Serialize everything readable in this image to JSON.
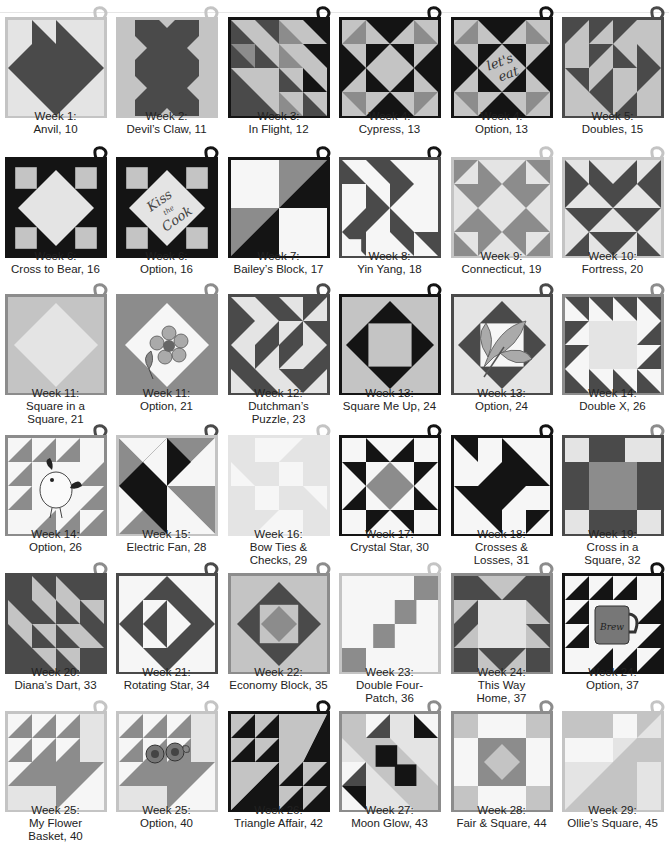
{
  "palette": {
    "black": "#141414",
    "dark": "#4a4a4a",
    "mid": "#8c8c8c",
    "light": "#c4c4c4",
    "pale": "#e4e4e4",
    "white": "#f6f6f6"
  },
  "blocks": [
    {
      "week": "Week 1:",
      "name": "Anvil, 10",
      "pattern": "anvil",
      "border": "light",
      "loop": "light"
    },
    {
      "week": "Week 2:",
      "name": "Devil’s Claw, 11",
      "pattern": "devils-claw",
      "border": "light",
      "loop": "light"
    },
    {
      "week": "Week 3:",
      "name": "In Flight, 12",
      "pattern": "in-flight",
      "border": "black",
      "loop": "black"
    },
    {
      "week": "Week 4:",
      "name": "Cypress, 13",
      "pattern": "cypress",
      "border": "black",
      "loop": "black"
    },
    {
      "week": "Week 4:",
      "name": "Option, 13",
      "pattern": "cypress-option",
      "border": "black",
      "loop": "black",
      "embroidery": "let's eat"
    },
    {
      "week": "Week 5:",
      "name": "Doubles, 15",
      "pattern": "doubles",
      "border": "dark",
      "loop": "dark"
    },
    {
      "week": "Week 6:",
      "name": "Cross to Bear, 16",
      "pattern": "cross-to-bear",
      "border": "black",
      "loop": "black"
    },
    {
      "week": "Week 6:",
      "name": "Option, 16",
      "pattern": "cross-option",
      "border": "black",
      "loop": "black",
      "embroidery": "Kiss the Cook"
    },
    {
      "week": "Week 7:",
      "name": "Bailey’s Block, 17",
      "pattern": "baileys",
      "border": "black",
      "loop": "black"
    },
    {
      "week": "Week 8:",
      "name": "Yin Yang, 18",
      "pattern": "yin-yang",
      "border": "dark",
      "loop": "black"
    },
    {
      "week": "Week 9:",
      "name": "Connecticut, 19",
      "pattern": "connecticut",
      "border": "light",
      "loop": "light"
    },
    {
      "week": "Week 10:",
      "name": "Fortress, 20",
      "pattern": "fortress",
      "border": "light",
      "loop": "light"
    },
    {
      "week": "Week 11:",
      "name": "Square in a Square, 21",
      "caption_lines": [
        "Week 11:",
        "Square in a",
        "Square, 21"
      ],
      "pattern": "square-in-square",
      "border": "mid",
      "loop": "mid"
    },
    {
      "week": "Week 11:",
      "name": "Option, 21",
      "pattern": "square-option",
      "border": "mid",
      "loop": "mid"
    },
    {
      "week": "Week 12:",
      "name": "Dutchman’s Puzzle, 23",
      "caption_lines": [
        "Week 12:",
        "Dutchman’s",
        "Puzzle, 23"
      ],
      "pattern": "dutchman",
      "border": "dark",
      "loop": "dark"
    },
    {
      "week": "Week 13:",
      "name": "Square Me Up, 24",
      "pattern": "square-me-up",
      "border": "black",
      "loop": "black"
    },
    {
      "week": "Week 13:",
      "name": "Option, 24",
      "pattern": "square-me-up-option",
      "border": "dark",
      "loop": "dark"
    },
    {
      "week": "Week 14:",
      "name": "Double X, 26",
      "pattern": "double-x",
      "border": "mid",
      "loop": "mid"
    },
    {
      "week": "Week 14:",
      "name": "Option, 26",
      "pattern": "double-x-option",
      "border": "mid",
      "loop": "dark"
    },
    {
      "week": "Week 15:",
      "name": "Electric Fan, 28",
      "pattern": "electric-fan",
      "border": "light",
      "loop": "dark"
    },
    {
      "week": "Week 16:",
      "name": "Bow Ties & Checks, 29",
      "caption_lines": [
        "Week 16:",
        "Bow Ties &",
        "Checks, 29"
      ],
      "pattern": "bow-ties",
      "border": "pale",
      "loop": "light"
    },
    {
      "week": "Week 17:",
      "name": "Crystal Star, 30",
      "pattern": "crystal-star",
      "border": "black",
      "loop": "black"
    },
    {
      "week": "Week 18:",
      "name": "Crosses & Losses, 31",
      "caption_lines": [
        "Week 18:",
        "Crosses &",
        "Losses, 31"
      ],
      "pattern": "crosses-losses",
      "border": "black",
      "loop": "black"
    },
    {
      "week": "Week 19:",
      "name": "Cross in a Square, 32",
      "caption_lines": [
        "Week 19:",
        "Cross in a",
        "Square, 32"
      ],
      "pattern": "cross-in-square",
      "border": "dark",
      "loop": "mid"
    },
    {
      "week": "Week 20:",
      "name": "Diana’s Dart, 33",
      "pattern": "dianas-dart",
      "border": "dark",
      "loop": "mid"
    },
    {
      "week": "Week 21:",
      "name": "Rotating Star, 34",
      "pattern": "rotating-star",
      "border": "dark",
      "loop": "dark"
    },
    {
      "week": "Week 22:",
      "name": "Economy Block, 35",
      "pattern": "economy",
      "border": "mid",
      "loop": "mid"
    },
    {
      "week": "Week 23:",
      "name": "Double Four-Patch, 36",
      "caption_lines": [
        "Week 23:",
        "Double Four-",
        "Patch, 36"
      ],
      "pattern": "double-four-patch",
      "border": "light",
      "loop": "light"
    },
    {
      "week": "Week 24:",
      "name": "This Way Home, 37",
      "caption_lines": [
        "Week 24:",
        "This Way",
        "Home, 37"
      ],
      "pattern": "this-way-home",
      "border": "mid",
      "loop": "mid"
    },
    {
      "week": "Week 24:",
      "name": "Option, 37",
      "pattern": "this-way-option",
      "border": "black",
      "loop": "black",
      "embroidery": "Brew"
    },
    {
      "week": "Week 25:",
      "name": "My Flower Basket, 40",
      "caption_lines": [
        "Week 25:",
        "My Flower",
        "Basket, 40"
      ],
      "pattern": "flower-basket",
      "border": "light",
      "loop": "light"
    },
    {
      "week": "Week 25:",
      "name": "Option, 40",
      "pattern": "flower-basket-option",
      "border": "light",
      "loop": "light"
    },
    {
      "week": "Week 26:",
      "name": "Triangle Affair, 42",
      "pattern": "triangle-affair",
      "border": "black",
      "loop": "black"
    },
    {
      "week": "Week 27:",
      "name": "Moon Glow, 43",
      "pattern": "moon-glow",
      "border": "mid",
      "loop": "mid"
    },
    {
      "week": "Week 28:",
      "name": "Fair & Square, 44",
      "pattern": "fair-square",
      "border": "mid",
      "loop": "mid"
    },
    {
      "week": "Week 29:",
      "name": "Ollie’s Square, 45",
      "pattern": "ollies-square",
      "border": "light",
      "loop": "light"
    }
  ]
}
